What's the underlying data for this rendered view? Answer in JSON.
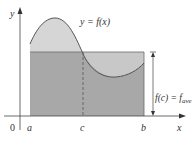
{
  "figure": {
    "type": "mean-value-theorem-for-integrals",
    "axis_labels": {
      "y": "y",
      "x": "x",
      "origin": "0"
    },
    "curve_label": "y = f(x)",
    "ticks": {
      "a": "a",
      "c": "c",
      "b": "b"
    },
    "average_label_main": "f(c) = f",
    "average_label_sub": "ave",
    "colors": {
      "curve_fill": "#d4d4d4",
      "rectangle_fill": "#a9a9a9",
      "curve_stroke": "#555555",
      "axis": "#444444"
    }
  }
}
